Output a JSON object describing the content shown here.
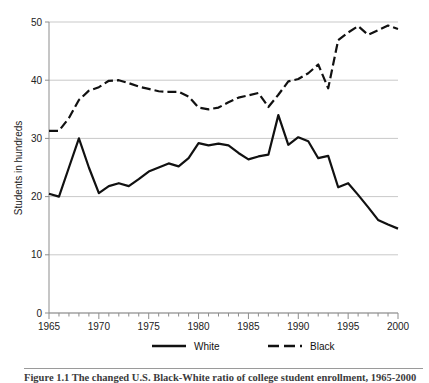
{
  "axes": {
    "ylabel": "Students in hundreds",
    "yticks": [
      "0",
      "10",
      "20",
      "30",
      "40",
      "50"
    ],
    "xticks": [
      "1965",
      "1970",
      "1975",
      "1980",
      "1985",
      "1990",
      "1995",
      "2000"
    ]
  },
  "legend": {
    "items": [
      {
        "label": "White",
        "style": "solid",
        "color": "#111111"
      },
      {
        "label": "Black",
        "style": "dashed",
        "color": "#111111"
      }
    ]
  },
  "caption": {
    "text": "Figure 1.1  The changed U.S. Black-White ratio of college student enrollment, 1965-2000"
  },
  "chart_data": {
    "type": "line",
    "title": "",
    "xlabel": "",
    "ylabel": "Students in hundreds",
    "xlim": [
      1965,
      2000
    ],
    "ylim": [
      0,
      50
    ],
    "grid": true,
    "legend_position": "bottom",
    "x": [
      1965,
      1966,
      1967,
      1968,
      1969,
      1970,
      1971,
      1972,
      1973,
      1974,
      1975,
      1976,
      1977,
      1978,
      1979,
      1980,
      1981,
      1982,
      1983,
      1984,
      1985,
      1986,
      1987,
      1988,
      1989,
      1990,
      1991,
      1992,
      1993,
      1994,
      1995,
      1996,
      1997,
      1998,
      1999,
      2000
    ],
    "series": [
      {
        "name": "White",
        "style": "solid",
        "color": "#111111",
        "values": [
          20.5,
          20.0,
          25.0,
          30.0,
          25.0,
          20.6,
          21.8,
          22.3,
          21.8,
          23.0,
          24.3,
          25.0,
          25.7,
          25.2,
          26.6,
          29.2,
          28.8,
          29.1,
          28.8,
          27.5,
          26.4,
          26.9,
          27.2,
          34.0,
          28.9,
          30.2,
          29.5,
          26.6,
          27.0,
          21.6,
          22.3,
          20.3,
          18.2,
          16.0,
          15.2,
          14.5
        ]
      },
      {
        "name": "Black",
        "style": "dashed",
        "color": "#111111",
        "values": [
          31.3,
          31.3,
          33.5,
          36.6,
          38.2,
          38.8,
          39.9,
          40.0,
          39.5,
          38.9,
          38.5,
          38.1,
          38.0,
          38.0,
          37.2,
          35.3,
          35.0,
          35.3,
          36.2,
          37.0,
          37.4,
          37.8,
          35.4,
          37.5,
          39.8,
          40.2,
          41.2,
          42.7,
          38.6,
          46.9,
          48.2,
          49.3,
          47.8,
          48.6,
          49.4,
          48.8
        ]
      }
    ]
  }
}
